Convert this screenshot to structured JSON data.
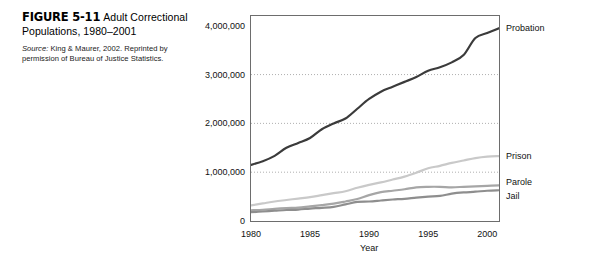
{
  "figure": {
    "number": "FIGURE 5-11",
    "title": "Adult Correctional Populations, 1980–2001",
    "source_word": "Source:",
    "source_text": " King & Maurer, 2002. Reprinted by permission of Bureau of Justice Statistics."
  },
  "chart_data": {
    "type": "line",
    "title": "Adult Correctional Populations, 1980–2001",
    "xlabel": "Year",
    "ylabel": "",
    "xlim": [
      1980,
      2001
    ],
    "ylim": [
      0,
      4200000
    ],
    "grid": "horizontal-dotted",
    "legend": "right-inline-labels",
    "ytick_labels": [
      "0",
      "1,000,000",
      "2,000,000",
      "3,000,000",
      "4,000,000"
    ],
    "ytick_values": [
      0,
      1000000,
      2000000,
      3000000,
      4000000
    ],
    "xtick_labels": [
      "1980",
      "1985",
      "1990",
      "1995",
      "2000"
    ],
    "xtick_values": [
      1980,
      1985,
      1990,
      1995,
      2000
    ],
    "x": [
      1980,
      1981,
      1982,
      1983,
      1984,
      1985,
      1986,
      1987,
      1988,
      1989,
      1990,
      1991,
      1992,
      1993,
      1994,
      1995,
      1996,
      1997,
      1998,
      1999,
      2000,
      2001
    ],
    "series": [
      {
        "name": "Probation",
        "color": "#3b3b3b",
        "width": 2.2,
        "values": [
          1150000,
          1225000,
          1335000,
          1500000,
          1600000,
          1700000,
          1880000,
          2000000,
          2100000,
          2300000,
          2500000,
          2650000,
          2750000,
          2850000,
          2950000,
          3080000,
          3150000,
          3250000,
          3400000,
          3750000,
          3850000,
          3950000
        ]
      },
      {
        "name": "Prison",
        "color": "#c9c9c9",
        "width": 2.2,
        "values": [
          320000,
          360000,
          400000,
          430000,
          460000,
          490000,
          530000,
          570000,
          610000,
          680000,
          740000,
          790000,
          850000,
          910000,
          990000,
          1080000,
          1130000,
          1190000,
          1240000,
          1290000,
          1320000,
          1330000
        ]
      },
      {
        "name": "Parole",
        "color": "#a6a6a6",
        "width": 2.2,
        "values": [
          220000,
          230000,
          250000,
          265000,
          275000,
          300000,
          325000,
          355000,
          400000,
          450000,
          530000,
          590000,
          620000,
          650000,
          690000,
          700000,
          700000,
          690000,
          700000,
          710000,
          720000,
          730000
        ]
      },
      {
        "name": "Jail",
        "color": "#8e8e8e",
        "width": 2.2,
        "values": [
          180000,
          195000,
          210000,
          225000,
          235000,
          255000,
          270000,
          290000,
          340000,
          390000,
          400000,
          420000,
          440000,
          455000,
          480000,
          500000,
          515000,
          560000,
          585000,
          600000,
          620000,
          630000
        ]
      }
    ]
  }
}
